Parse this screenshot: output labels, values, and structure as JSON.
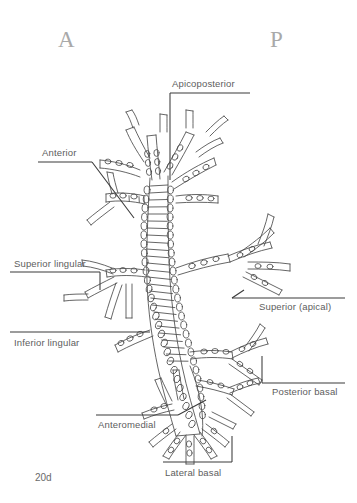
{
  "figure": {
    "number": "20d",
    "orientation": {
      "anterior_marker": "A",
      "posterior_marker": "P"
    },
    "ink_color": "#4a4a4a",
    "label_color": "#5d5d5d",
    "marker_color": "#a9a9a9",
    "background_color": "#ffffff"
  },
  "labels": {
    "apicoposterior": "Apicoposterior",
    "anterior": "Anterior",
    "superior_lingular": "Superior lingular",
    "inferior_lingular": "Inferior lingular",
    "superior_apical": "Superior (apical)",
    "posterior_basal": "Posterior basal",
    "anteromedial": "Anteromedial",
    "lateral_basal": "Lateral basal"
  }
}
